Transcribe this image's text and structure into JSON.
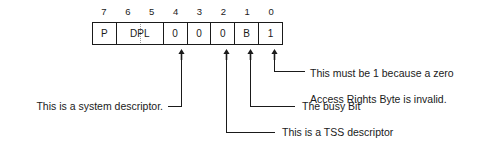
{
  "diagram": {
    "type": "bit-field",
    "stroke_color": "#1a1a1a",
    "background_color": "#ffffff",
    "bit_labels": [
      "7",
      "6",
      "5",
      "4",
      "3",
      "2",
      "1",
      "0"
    ],
    "fields": [
      {
        "name": "present-bit",
        "label": "P",
        "bits": "7",
        "span": 1
      },
      {
        "name": "dpl-field",
        "label": "DPL",
        "bits": "6-5",
        "span": 2,
        "dotted_split": true
      },
      {
        "name": "bit-4-system",
        "label": "0",
        "bits": "4",
        "span": 1
      },
      {
        "name": "bit-3",
        "label": "0",
        "bits": "3",
        "span": 1
      },
      {
        "name": "bit-2-tss",
        "label": "0",
        "bits": "2",
        "span": 1
      },
      {
        "name": "busy-bit",
        "label": "B",
        "bits": "1",
        "span": 1
      },
      {
        "name": "bit-0-must-be-one",
        "label": "1",
        "bits": "0",
        "span": 1
      }
    ],
    "annotations": [
      {
        "name": "annotation-must-be-one",
        "target_bit": "0",
        "side": "right",
        "text": "This must be 1 because a zero\nAccess Rights Byte is invalid.",
        "line1": "This must be 1 because a zero",
        "line2": "Access Rights Byte is invalid."
      },
      {
        "name": "annotation-busy-bit",
        "target_bit": "1",
        "side": "right",
        "text": "The busy Bit",
        "line1": "The busy Bit"
      },
      {
        "name": "annotation-tss-descriptor",
        "target_bit": "2",
        "side": "right",
        "text": "This is a TSS descriptor",
        "line1": "This is a TSS descriptor"
      },
      {
        "name": "annotation-system-descriptor",
        "target_bit": "4",
        "side": "left",
        "text": "This is a system descriptor.",
        "line1": "This is a system descriptor."
      }
    ]
  }
}
